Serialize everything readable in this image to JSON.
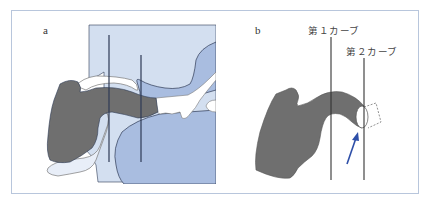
{
  "figure": {
    "panels": [
      {
        "id": "a",
        "label": "a"
      },
      {
        "id": "b",
        "label": "b",
        "curve_labels": [
          "第１カーブ",
          "第２カーブ"
        ]
      }
    ],
    "colors": {
      "frame_border": "#b8c6dc",
      "light_blue": "#d3dff0",
      "mid_blue": "#a9bde0",
      "tube_gray": "#6f6f6f",
      "outline": "#2e3a55",
      "arrow_blue": "#2e4fa8",
      "line_dark": "#333333"
    }
  }
}
